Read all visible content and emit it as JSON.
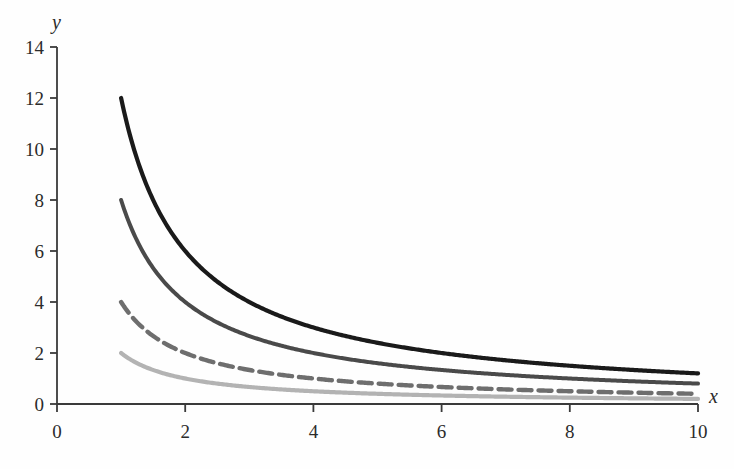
{
  "chart_data": {
    "type": "line",
    "title": "",
    "subtitle": "",
    "xlabel": "x",
    "ylabel": "y",
    "xlim": [
      0,
      10
    ],
    "ylim": [
      0,
      14
    ],
    "xticks": [
      0,
      2,
      4,
      6,
      8,
      10
    ],
    "yticks": [
      0,
      2,
      4,
      6,
      8,
      10,
      12,
      14
    ],
    "xtick_labels": [
      "0",
      "2",
      "4",
      "6",
      "8",
      "10"
    ],
    "ytick_labels": [
      "0",
      "2",
      "4",
      "6",
      "8",
      "10",
      "12",
      "14"
    ],
    "grid": false,
    "legend": null,
    "legend_position": "none",
    "x": [
      1,
      1.25,
      1.5,
      1.75,
      2,
      2.5,
      3,
      3.5,
      4,
      4.5,
      5,
      5.5,
      6,
      6.5,
      7,
      7.5,
      8,
      8.5,
      9,
      9.5,
      10
    ],
    "series": [
      {
        "name": "k = 12",
        "k": 12,
        "formula": "y = 12 / x",
        "color": "#1a1a1a",
        "style": "solid",
        "width": 4.2,
        "values": [
          12,
          9.6,
          8,
          6.857,
          6,
          4.8,
          4,
          3.429,
          3,
          2.667,
          2.4,
          2.182,
          2,
          1.846,
          1.714,
          1.6,
          1.5,
          1.412,
          1.333,
          1.263,
          1.2
        ]
      },
      {
        "name": "k = 8",
        "k": 8,
        "formula": "y = 8 / x",
        "color": "#4a4a4a",
        "style": "solid",
        "width": 4.0,
        "values": [
          8,
          6.4,
          5.333,
          4.571,
          4,
          3.2,
          2.667,
          2.286,
          2,
          1.778,
          1.6,
          1.455,
          1.333,
          1.231,
          1.143,
          1.067,
          1,
          0.941,
          0.889,
          0.842,
          0.8
        ]
      },
      {
        "name": "k = 4",
        "k": 4,
        "formula": "y = 4 / x",
        "color": "#6e6e6e",
        "style": "dashed",
        "width": 4.4,
        "dash": "13 7",
        "values": [
          4,
          3.2,
          2.667,
          2.286,
          2,
          1.6,
          1.333,
          1.143,
          1,
          0.889,
          0.8,
          0.727,
          0.667,
          0.615,
          0.571,
          0.533,
          0.5,
          0.471,
          0.444,
          0.421,
          0.4
        ]
      },
      {
        "name": "k = 2",
        "k": 2,
        "formula": "y = 2 / x",
        "color": "#b3b3b3",
        "style": "solid",
        "width": 4.2,
        "values": [
          2,
          1.6,
          1.333,
          1.143,
          1,
          0.8,
          0.667,
          0.571,
          0.5,
          0.444,
          0.4,
          0.364,
          0.333,
          0.308,
          0.286,
          0.267,
          0.25,
          0.235,
          0.222,
          0.211,
          0.2
        ]
      }
    ],
    "axis_color": "#3a3a3a",
    "background": "#fefefe"
  },
  "geometry": {
    "origin_x": 57,
    "origin_y": 404,
    "x_per_unit": 64.1,
    "y_per_unit": 25.5,
    "axis_top_y": 47,
    "axis_right_x": 698
  }
}
